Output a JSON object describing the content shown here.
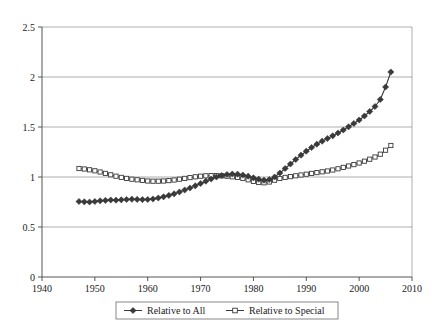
{
  "chart_data": {
    "type": "line",
    "title": "",
    "xlabel": "",
    "ylabel": "",
    "xlim": [
      1940,
      2010
    ],
    "ylim": [
      0,
      2.5
    ],
    "xticks": [
      "1940",
      "1950",
      "1960",
      "1970",
      "1980",
      "1990",
      "2000",
      "2010"
    ],
    "yticks": [
      "0",
      "0.5",
      "1",
      "1.5",
      "2",
      "2.5"
    ],
    "grid": "horizontal",
    "legend_position": "bottom",
    "x": [
      1947,
      1948,
      1949,
      1950,
      1951,
      1952,
      1953,
      1954,
      1955,
      1956,
      1957,
      1958,
      1959,
      1960,
      1961,
      1962,
      1963,
      1964,
      1965,
      1966,
      1967,
      1968,
      1969,
      1970,
      1971,
      1972,
      1973,
      1974,
      1975,
      1976,
      1977,
      1978,
      1979,
      1980,
      1981,
      1982,
      1983,
      1984,
      1985,
      1986,
      1987,
      1988,
      1989,
      1990,
      1991,
      1992,
      1993,
      1994,
      1995,
      1996,
      1997,
      1998,
      1999,
      2000,
      2001,
      2002,
      2003,
      2004,
      2005,
      2006
    ],
    "series": [
      {
        "name": "Relative to All",
        "marker": "filled-diamond",
        "color": "#3a3a3a",
        "values": [
          0.755,
          0.752,
          0.75,
          0.755,
          0.762,
          0.766,
          0.77,
          0.768,
          0.772,
          0.775,
          0.778,
          0.776,
          0.774,
          0.775,
          0.78,
          0.79,
          0.802,
          0.816,
          0.832,
          0.85,
          0.87,
          0.89,
          0.912,
          0.935,
          0.958,
          0.98,
          1.0,
          1.015,
          1.025,
          1.03,
          1.028,
          1.02,
          1.008,
          0.992,
          0.978,
          0.968,
          0.975,
          1.0,
          1.04,
          1.085,
          1.13,
          1.175,
          1.218,
          1.258,
          1.295,
          1.328,
          1.358,
          1.385,
          1.412,
          1.44,
          1.47,
          1.502,
          1.535,
          1.57,
          1.61,
          1.655,
          1.705,
          1.775,
          1.9,
          2.05
        ]
      },
      {
        "name": "Relative to Special",
        "marker": "open-square",
        "color": "#3a3a3a",
        "values": [
          1.085,
          1.08,
          1.072,
          1.062,
          1.05,
          1.036,
          1.022,
          1.008,
          0.996,
          0.986,
          0.978,
          0.972,
          0.966,
          0.96,
          0.958,
          0.958,
          0.96,
          0.964,
          0.97,
          0.978,
          0.986,
          0.994,
          1.002,
          1.008,
          1.012,
          1.014,
          1.014,
          1.012,
          1.008,
          1.002,
          0.996,
          0.986,
          0.972,
          0.956,
          0.945,
          0.942,
          0.95,
          0.968,
          0.985,
          0.996,
          1.004,
          1.012,
          1.02,
          1.028,
          1.036,
          1.044,
          1.052,
          1.06,
          1.07,
          1.082,
          1.096,
          1.11,
          1.124,
          1.14,
          1.158,
          1.178,
          1.2,
          1.228,
          1.268,
          1.315
        ]
      }
    ]
  },
  "legend": {
    "entries": [
      {
        "label": "Relative to All",
        "marker": "filled-diamond"
      },
      {
        "label": "Relative to Special",
        "marker": "open-square"
      }
    ]
  }
}
